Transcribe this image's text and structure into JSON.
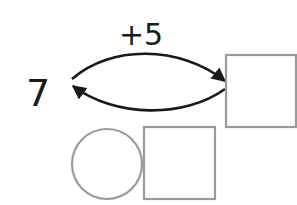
{
  "diagram": {
    "start_number": "7",
    "operation_label": "+5",
    "forward_arrow": {
      "from": "start-number",
      "to": "result-box",
      "label": "+5"
    },
    "backward_arrow": {
      "from": "result-box",
      "to": "start-number",
      "label": ""
    },
    "result_box": {
      "value": ""
    },
    "inverse_row": {
      "operator_circle": {
        "value": ""
      },
      "answer_box": {
        "value": ""
      }
    }
  },
  "colors": {
    "arrow": "#1a1a1a",
    "text": "#1a1a1a",
    "box_stroke": "#9a9a9a",
    "background": "#ffffff"
  }
}
